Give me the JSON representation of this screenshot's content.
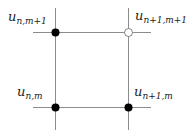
{
  "diagram": {
    "type": "stencil-grid",
    "line_color": "#8c8c8c",
    "point_color": "#000000",
    "nodes": [
      {
        "id": "top-left",
        "base": "u",
        "sub": "n,m+1",
        "filled": true
      },
      {
        "id": "top-right",
        "base": "u",
        "sub": "n+1,m+1",
        "filled": false
      },
      {
        "id": "bottom-left",
        "base": "u",
        "sub": "n,m",
        "filled": true
      },
      {
        "id": "bottom-right",
        "base": "u",
        "sub": "n+1,m",
        "filled": true
      }
    ]
  }
}
